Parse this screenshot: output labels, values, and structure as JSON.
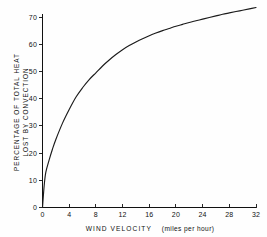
{
  "chart_data": {
    "type": "line",
    "title": "",
    "xlabel": "WIND VELOCITY (miles per hour)",
    "xlabel_main": "WIND  VELOCITY",
    "xlabel_unit": "(miles per hour)",
    "ylabel": "PERCENTAGE OF TOTAL HEAT LOST BY CONVECTION",
    "ylabel_line1": "PERCENTAGE OF TOTAL HEAT",
    "ylabel_line2": "LOST BY CONVECTION",
    "xlim": [
      0,
      32
    ],
    "ylim": [
      0,
      74
    ],
    "xticks": [
      0,
      4,
      8,
      12,
      16,
      20,
      24,
      28,
      32
    ],
    "xtick_labels": [
      "0",
      "4",
      "8",
      "12",
      "16",
      "20",
      "24",
      "28",
      "32"
    ],
    "yticks": [
      0,
      10,
      20,
      30,
      40,
      50,
      60,
      70
    ],
    "ytick_labels": [
      "0",
      "10",
      "20",
      "30",
      "40",
      "50",
      "60",
      "70"
    ],
    "grid": false,
    "legend": false,
    "series": [
      {
        "name": "Convection heat loss",
        "color": "#1b1b1b",
        "x": [
          0,
          0.25,
          0.5,
          1,
          1.5,
          2,
          3,
          4,
          5,
          6,
          7,
          8,
          9,
          10,
          11,
          12,
          13,
          14,
          15,
          16,
          17,
          18,
          19,
          20,
          21,
          22,
          23,
          24,
          25,
          26,
          27,
          28,
          29,
          30,
          31,
          32
        ],
        "y": [
          0,
          8,
          13,
          17.5,
          21.5,
          25,
          31,
          36,
          40.5,
          44,
          47,
          49.5,
          52,
          54.2,
          56.2,
          58,
          59.5,
          60.8,
          62,
          63.1,
          64.1,
          65,
          65.8,
          66.6,
          67.3,
          68,
          68.6,
          69.2,
          69.8,
          70.4,
          71,
          71.5,
          72,
          72.5,
          73,
          73.5
        ]
      }
    ]
  },
  "axis_colors": {
    "axis": "#111111",
    "curve": "#1b1b1b",
    "background": "#fefefe"
  }
}
